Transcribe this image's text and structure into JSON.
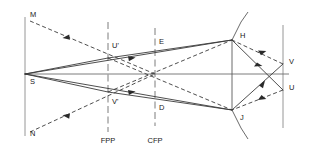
{
  "diagram": {
    "background_color": "#ffffff",
    "line_color": "#3a3a3a",
    "axis_color": "#6e6e6e",
    "label_color": "#1a1a1a",
    "width": 309,
    "height": 150
  },
  "points": {
    "M": {
      "label": "M",
      "x": 30,
      "y": 17
    },
    "N": {
      "label": "N",
      "x": 30,
      "y": 136
    },
    "S": {
      "label": "S",
      "x": 30,
      "y": 84
    },
    "U_prime": {
      "label": "U'",
      "x": 112,
      "y": 48
    },
    "V_prime": {
      "label": "V'",
      "x": 112,
      "y": 104
    },
    "E": {
      "label": "E",
      "x": 159,
      "y": 44
    },
    "D": {
      "label": "D",
      "x": 159,
      "y": 110
    },
    "H": {
      "label": "H",
      "x": 240,
      "y": 38
    },
    "J": {
      "label": "J",
      "x": 240,
      "y": 120
    },
    "V": {
      "label": "V",
      "x": 289,
      "y": 64
    },
    "U": {
      "label": "U",
      "x": 289,
      "y": 90
    }
  },
  "planes": [
    {
      "name": "front-focal-plane",
      "label": "FPP",
      "x": 108,
      "label_y": 143
    },
    {
      "name": "common-focal-plane",
      "label": "CFP",
      "x": 155,
      "label_y": 143
    }
  ],
  "vertical_lines": [
    {
      "name": "object-screen",
      "x": 25,
      "y1": 17,
      "y2": 136
    },
    {
      "name": "image-screen",
      "x": 283,
      "y1": 25,
      "y2": 128
    }
  ],
  "axis": {
    "name": "optical-axis",
    "x1": 25,
    "y1": 74,
    "x2": 289,
    "y2": 74
  },
  "mirrors": [
    {
      "name": "upper-mirror",
      "vertex_x": 232,
      "vertex_y": 40,
      "tip_x": 248,
      "tip_y": 12
    },
    {
      "name": "lower-mirror",
      "vertex_x": 232,
      "vertex_y": 110,
      "tip_x": 248,
      "tip_y": 139
    }
  ],
  "rays": {
    "solid_count": 8,
    "dashed_count": 8,
    "description": "Solid rays are real light paths; dashed rays are virtual/back-projected paths"
  }
}
